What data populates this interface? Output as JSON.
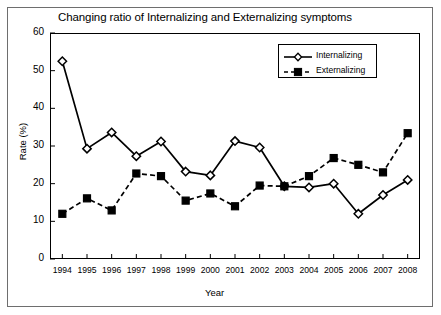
{
  "chart_data": {
    "type": "line",
    "title": "Changing ratio of Internalizing and Externalizing symptoms",
    "xlabel": "Year",
    "ylabel": "Rate (%)",
    "categories": [
      "1994",
      "1995",
      "1996",
      "1997",
      "1998",
      "1999",
      "2000",
      "2001",
      "2002",
      "2003",
      "2004",
      "2005",
      "2006",
      "2007",
      "2008"
    ],
    "x": [
      1994,
      1995,
      1996,
      1997,
      1998,
      1999,
      2000,
      2001,
      2002,
      2003,
      2004,
      2005,
      2006,
      2007,
      2008
    ],
    "ylim": [
      0,
      60
    ],
    "yticks": [
      0,
      10,
      20,
      30,
      40,
      50,
      60
    ],
    "grid": false,
    "legend_position": "top-right",
    "series": [
      {
        "name": "Internalizing",
        "marker": "diamond-open",
        "linestyle": "solid",
        "color": "#000000",
        "values": [
          52.5,
          29.3,
          33.6,
          27.3,
          31.2,
          23.2,
          22.2,
          31.3,
          29.6,
          19.3,
          19.0,
          20.0,
          12.0,
          17.0,
          21.0
        ]
      },
      {
        "name": "Externalizing",
        "marker": "square-filled",
        "linestyle": "dashed",
        "color": "#000000",
        "values": [
          12.0,
          16.1,
          12.9,
          22.7,
          22.0,
          15.5,
          17.4,
          14.0,
          19.5,
          19.3,
          22.0,
          26.8,
          25.0,
          23.0,
          33.4
        ]
      }
    ]
  },
  "legend": {
    "items": [
      {
        "label": "Internalizing"
      },
      {
        "label": "Externalizing"
      }
    ]
  }
}
